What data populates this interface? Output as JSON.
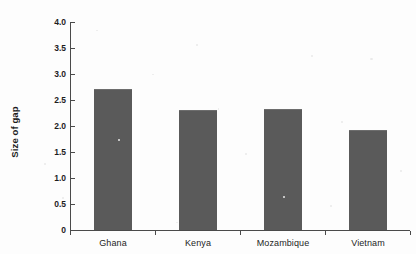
{
  "chart_data": {
    "type": "bar",
    "title": "",
    "xlabel": "",
    "ylabel": "Size of gap",
    "categories": [
      "Ghana",
      "Kenya",
      "Mozambique",
      "Vietnam"
    ],
    "values": [
      2.71,
      2.31,
      2.32,
      1.92
    ],
    "ylim": [
      0,
      4.0
    ],
    "ytick_values": [
      0,
      0.5,
      1.0,
      1.5,
      2.0,
      2.5,
      3.0,
      3.5,
      4.0
    ],
    "ytick_labels": [
      "0",
      "0.5",
      "1.0",
      "1.5",
      "2.0",
      "2.5",
      "3.0",
      "3.5",
      "4.0"
    ],
    "grid": false,
    "legend": null,
    "legend_position": "none",
    "bar_color": "#5a5a5a",
    "axis_color": "#4a4a4a",
    "background_color": "#fdfdfd"
  },
  "figure": {
    "cropped_top_text": "........."
  }
}
